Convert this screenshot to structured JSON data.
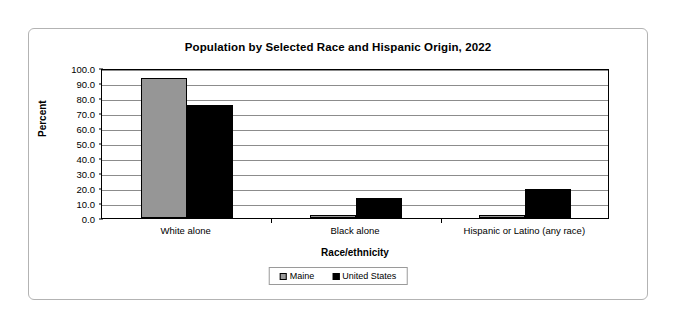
{
  "chart_data": {
    "type": "bar",
    "title": "Population by Selected Race and Hispanic Origin, 2022",
    "xlabel": "Race/ethnicity",
    "ylabel": "Percent",
    "categories": [
      "White alone",
      "Black alone",
      "Hispanic or Latino (any race)"
    ],
    "series": [
      {
        "name": "Maine",
        "color": "#969696",
        "values": [
          93.5,
          1.8,
          2.0
        ]
      },
      {
        "name": "United States",
        "color": "#000000",
        "values": [
          75.5,
          13.6,
          19.1
        ]
      }
    ],
    "ylim": [
      0.0,
      100.0
    ],
    "ytick_step": 10.0,
    "ytick_labels": [
      "0.0",
      "10.0",
      "20.0",
      "30.0",
      "40.0",
      "50.0",
      "60.0",
      "70.0",
      "80.0",
      "90.0",
      "100.0"
    ],
    "grid": true,
    "legend_position": "bottom"
  }
}
